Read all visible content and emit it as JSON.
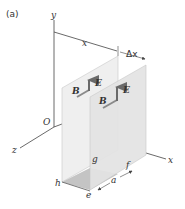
{
  "figure": {
    "panel_label": "(a)",
    "axes": {
      "x": "x",
      "y": "y",
      "z": "z",
      "origin": "O"
    },
    "dimensions": {
      "distance": "x",
      "delta": "Δx",
      "width": "a"
    },
    "vectors": {
      "electric": "E",
      "magnetic": "B"
    },
    "vertices": {
      "e": "e",
      "f": "f",
      "g": "g",
      "h": "h"
    },
    "colors": {
      "plane_back": "#ececec",
      "plane_front": "#e0e0e0",
      "base_rect": "#bdbdbd",
      "axis": "#444444",
      "vector": "#777777"
    }
  }
}
